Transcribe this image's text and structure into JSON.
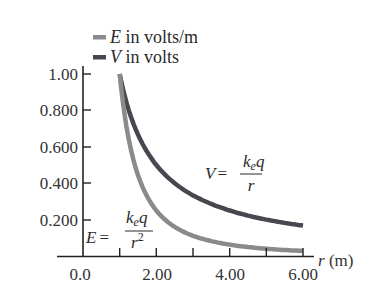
{
  "chart_data": {
    "type": "line",
    "title": "",
    "xlabel": "r (m)",
    "ylabel": "",
    "xlim": [
      0,
      6
    ],
    "ylim": [
      0,
      1
    ],
    "x_ticks": [
      "0.0",
      "2.00",
      "4.00",
      "6.00"
    ],
    "x_minor_ticks": [
      1,
      2,
      3,
      4,
      5,
      6
    ],
    "y_ticks": [
      "0.200",
      "0.400",
      "0.600",
      "0.800",
      "1.00"
    ],
    "grid": false,
    "legend_position": "top-left",
    "x": [
      1.0,
      1.25,
      1.5,
      2.0,
      2.5,
      3.0,
      3.5,
      4.0,
      4.5,
      5.0,
      5.5,
      6.0
    ],
    "series": [
      {
        "name": "E in volts/m",
        "symbol": "E",
        "unit_text": " in volts/m",
        "color": "#8a8a8a",
        "values": [
          1.0,
          0.64,
          0.444,
          0.25,
          0.16,
          0.111,
          0.082,
          0.0625,
          0.049,
          0.04,
          0.033,
          0.028
        ],
        "annotation": "E = k_e q / r^2"
      },
      {
        "name": "V in volts",
        "symbol": "V",
        "unit_text": " in volts",
        "color": "#4a4650",
        "values": [
          1.0,
          0.8,
          0.667,
          0.5,
          0.4,
          0.333,
          0.286,
          0.25,
          0.222,
          0.2,
          0.182,
          0.167
        ],
        "annotation": "V = k_e q / r"
      }
    ]
  },
  "legend": {
    "items": [
      {
        "symbol": "E",
        "text": " in volts/m"
      },
      {
        "symbol": "V",
        "text": " in volts"
      }
    ]
  },
  "axes": {
    "x_label_var": "r",
    "x_label_unit": " (m)",
    "y_tick_labels": [
      "1.00",
      "0.800",
      "0.600",
      "0.400",
      "0.200"
    ],
    "x_tick_labels": [
      "0.0",
      "2.00",
      "4.00",
      "6.00"
    ]
  },
  "annotations": {
    "v_eq": {
      "lhs": "V",
      "eq": "=",
      "num_k": "k",
      "num_sub": "e",
      "num_q": "q",
      "den": "r"
    },
    "e_eq": {
      "lhs": "E",
      "eq": "=",
      "num_k": "k",
      "num_sub": "e",
      "num_q": "q",
      "den": "r",
      "den_sup": "2"
    }
  }
}
